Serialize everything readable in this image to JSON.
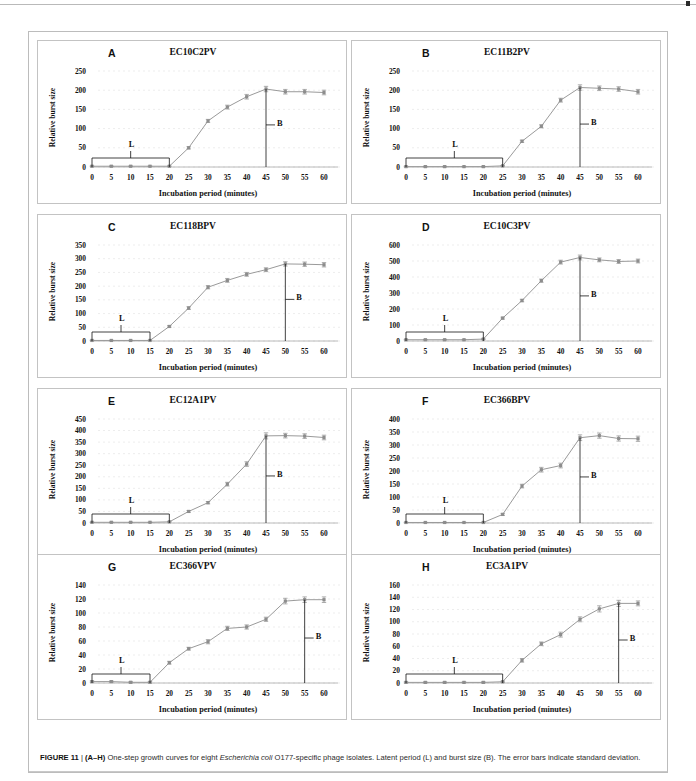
{
  "figure": {
    "label": "FIGURE 11",
    "separator": " | ",
    "panel_range": "(A–H)",
    "caption_part1": " One-step growth curves for eight ",
    "caption_species": "Escherichia coli",
    "caption_part2": " O177-specific phage isolates. Latent period (L) and burst size (B). The error bars indicate standard deviation.",
    "xlabel": "Incubation period (minutes)",
    "ylabel": "Relative burst size",
    "latent_marker": "L",
    "burst_marker": "B",
    "line_color": "#9a9a9a",
    "marker_color": "#8d8d8d",
    "annotation_color": "#111111"
  },
  "chart_data": [
    {
      "type": "line",
      "panel": "A",
      "title": "EC10C2PV",
      "xlabel": "Incubation period (minutes)",
      "ylabel": "Relative burst size",
      "x": [
        0,
        5,
        10,
        15,
        20,
        25,
        30,
        35,
        40,
        45,
        50,
        55,
        60
      ],
      "values": [
        2,
        2,
        2,
        2,
        2,
        50,
        120,
        156,
        183,
        203,
        196,
        196,
        194
      ],
      "errors": [
        1,
        1,
        1,
        1,
        1,
        3,
        4,
        5,
        6,
        7,
        6,
        6,
        6
      ],
      "xticks": [
        0,
        5,
        10,
        15,
        20,
        25,
        30,
        35,
        40,
        45,
        50,
        55,
        60
      ],
      "yticks": [
        0,
        50,
        100,
        150,
        200,
        250
      ],
      "ylim": [
        0,
        250
      ],
      "xlim": [
        0,
        60
      ],
      "latent_period_end": 20,
      "burst_x": 45,
      "burst_top": 203,
      "grid": true
    },
    {
      "type": "line",
      "panel": "B",
      "title": "EC11B2PV",
      "xlabel": "Incubation period (minutes)",
      "ylabel": "Relative burst size",
      "x": [
        0,
        5,
        10,
        15,
        20,
        25,
        30,
        35,
        40,
        45,
        50,
        55,
        60
      ],
      "values": [
        1,
        1,
        1,
        1,
        1,
        3,
        67,
        106,
        174,
        207,
        205,
        203,
        196
      ],
      "errors": [
        1,
        1,
        1,
        1,
        1,
        1,
        3,
        4,
        5,
        7,
        6,
        6,
        6
      ],
      "xticks": [
        0,
        5,
        10,
        15,
        20,
        25,
        30,
        35,
        40,
        45,
        50,
        55,
        60
      ],
      "yticks": [
        0,
        50,
        100,
        150,
        200,
        250
      ],
      "ylim": [
        0,
        250
      ],
      "xlim": [
        0,
        60
      ],
      "latent_period_end": 25,
      "burst_x": 45,
      "burst_top": 207,
      "grid": true
    },
    {
      "type": "line",
      "panel": "C",
      "title": "EC118BPV",
      "xlabel": "Incubation period (minutes)",
      "ylabel": "Relative burst size",
      "x": [
        0,
        5,
        10,
        15,
        20,
        25,
        30,
        35,
        40,
        45,
        50,
        55,
        60
      ],
      "values": [
        2,
        2,
        2,
        2,
        53,
        120,
        196,
        221,
        243,
        260,
        281,
        280,
        278
      ],
      "errors": [
        1,
        1,
        1,
        1,
        3,
        5,
        6,
        7,
        7,
        7,
        8,
        8,
        8
      ],
      "xticks": [
        0,
        5,
        10,
        15,
        20,
        25,
        30,
        35,
        40,
        45,
        50,
        55,
        60
      ],
      "yticks": [
        0,
        50,
        100,
        150,
        200,
        250,
        300,
        350
      ],
      "ylim": [
        0,
        350
      ],
      "xlim": [
        0,
        60
      ],
      "latent_period_end": 15,
      "burst_x": 50,
      "burst_top": 281,
      "grid": true
    },
    {
      "type": "line",
      "panel": "D",
      "title": "EC10C3PV",
      "xlabel": "Incubation period (minutes)",
      "ylabel": "Relative burst size",
      "x": [
        0,
        5,
        10,
        15,
        20,
        25,
        30,
        35,
        40,
        45,
        50,
        55,
        60
      ],
      "values": [
        8,
        8,
        8,
        8,
        12,
        143,
        253,
        377,
        493,
        522,
        507,
        497,
        500
      ],
      "errors": [
        2,
        2,
        2,
        2,
        2,
        6,
        8,
        10,
        12,
        15,
        12,
        12,
        12
      ],
      "xticks": [
        0,
        5,
        10,
        15,
        20,
        25,
        30,
        35,
        40,
        45,
        50,
        55,
        60
      ],
      "yticks": [
        0,
        100,
        200,
        300,
        400,
        500,
        600
      ],
      "ylim": [
        0,
        600
      ],
      "xlim": [
        0,
        60
      ],
      "latent_period_end": 20,
      "burst_x": 45,
      "burst_top": 522,
      "grid": true
    },
    {
      "type": "line",
      "panel": "E",
      "title": "EC12A1PV",
      "xlabel": "Incubation period (minutes)",
      "ylabel": "Relative burst size",
      "x": [
        0,
        5,
        10,
        15,
        20,
        25,
        30,
        35,
        40,
        45,
        50,
        55,
        60
      ],
      "values": [
        3,
        3,
        3,
        3,
        5,
        50,
        88,
        168,
        255,
        377,
        378,
        376,
        370
      ],
      "errors": [
        1,
        1,
        1,
        1,
        1,
        4,
        5,
        8,
        10,
        13,
        10,
        10,
        10
      ],
      "xticks": [
        0,
        5,
        10,
        15,
        20,
        25,
        30,
        35,
        40,
        45,
        50,
        55,
        60
      ],
      "yticks": [
        0,
        50,
        100,
        150,
        200,
        250,
        300,
        350,
        400,
        450
      ],
      "ylim": [
        0,
        450
      ],
      "xlim": [
        0,
        60
      ],
      "latent_period_end": 20,
      "burst_x": 45,
      "burst_top": 377,
      "grid": true
    },
    {
      "type": "line",
      "panel": "F",
      "title": "EC366BPV",
      "xlabel": "Incubation period (minutes)",
      "ylabel": "Relative burst size",
      "x": [
        0,
        5,
        10,
        15,
        20,
        25,
        30,
        35,
        40,
        45,
        50,
        55,
        60
      ],
      "values": [
        2,
        2,
        2,
        2,
        2,
        33,
        142,
        205,
        221,
        328,
        336,
        325,
        324
      ],
      "errors": [
        1,
        1,
        1,
        1,
        1,
        4,
        7,
        9,
        9,
        11,
        10,
        10,
        10
      ],
      "xticks": [
        0,
        5,
        10,
        15,
        20,
        25,
        30,
        35,
        40,
        45,
        50,
        55,
        60
      ],
      "yticks": [
        0,
        50,
        100,
        150,
        200,
        250,
        300,
        350,
        400
      ],
      "ylim": [
        0,
        400
      ],
      "xlim": [
        0,
        60
      ],
      "latent_period_end": 20,
      "burst_x": 45,
      "burst_top": 328,
      "grid": true
    },
    {
      "type": "line",
      "panel": "G",
      "title": "EC366VPV",
      "xlabel": "Incubation period (minutes)",
      "ylabel": "Relative burst size",
      "x": [
        0,
        5,
        10,
        15,
        20,
        25,
        30,
        35,
        40,
        45,
        50,
        55,
        60
      ],
      "values": [
        2,
        2,
        1,
        1,
        29,
        49,
        59,
        78,
        80,
        91,
        117,
        119,
        119
      ],
      "errors": [
        1,
        1,
        1,
        1,
        2,
        2,
        3,
        3,
        3,
        3,
        4,
        4,
        4
      ],
      "xticks": [
        0,
        5,
        10,
        15,
        20,
        25,
        30,
        35,
        40,
        45,
        50,
        55,
        60
      ],
      "yticks": [
        0,
        20,
        40,
        60,
        80,
        100,
        120,
        140
      ],
      "ylim": [
        0,
        140
      ],
      "xlim": [
        0,
        60
      ],
      "latent_period_end": 15,
      "burst_x": 55,
      "burst_top": 119,
      "grid": true
    },
    {
      "type": "line",
      "panel": "H",
      "title": "EC3A1PV",
      "xlabel": "Incubation period (minutes)",
      "ylabel": "Relative burst size",
      "x": [
        0,
        5,
        10,
        15,
        20,
        25,
        30,
        35,
        40,
        45,
        50,
        55,
        60
      ],
      "values": [
        1,
        1,
        1,
        1,
        1,
        2,
        37,
        64,
        79,
        104,
        121,
        130,
        130
      ],
      "errors": [
        1,
        1,
        1,
        1,
        1,
        1,
        3,
        3,
        4,
        4,
        5,
        5,
        4
      ],
      "xticks": [
        0,
        5,
        10,
        15,
        20,
        25,
        30,
        35,
        40,
        45,
        50,
        55,
        60
      ],
      "yticks": [
        0,
        20,
        40,
        60,
        80,
        100,
        120,
        140,
        160
      ],
      "ylim": [
        0,
        160
      ],
      "xlim": [
        0,
        60
      ],
      "latent_period_end": 25,
      "burst_x": 55,
      "burst_top": 130,
      "grid": true
    }
  ]
}
